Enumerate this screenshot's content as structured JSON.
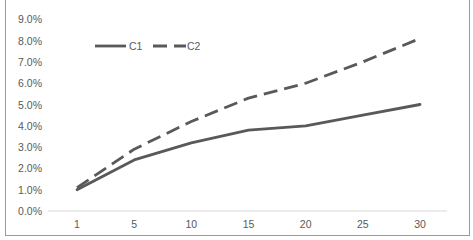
{
  "chart_data": {
    "type": "line",
    "title": "",
    "xlabel": "",
    "ylabel": "",
    "categories": [
      "1",
      "5",
      "10",
      "15",
      "20",
      "25",
      "30"
    ],
    "x": [
      1,
      5,
      10,
      15,
      20,
      25,
      30
    ],
    "series": [
      {
        "name": "C1",
        "style": "solid",
        "color": "#595959",
        "values": [
          1.0,
          2.4,
          3.2,
          3.8,
          4.0,
          4.5,
          5.0
        ]
      },
      {
        "name": "C2",
        "style": "dashed",
        "color": "#595959",
        "values": [
          1.1,
          2.9,
          4.2,
          5.3,
          6.0,
          7.0,
          8.1
        ]
      }
    ],
    "value_format": "percent",
    "ylim": [
      0,
      9
    ],
    "yticks": [
      "0.0%",
      "1.0%",
      "2.0%",
      "3.0%",
      "4.0%",
      "5.0%",
      "6.0%",
      "7.0%",
      "8.0%",
      "9.0%"
    ],
    "grid": false,
    "legend_position": "top-left-inside"
  }
}
